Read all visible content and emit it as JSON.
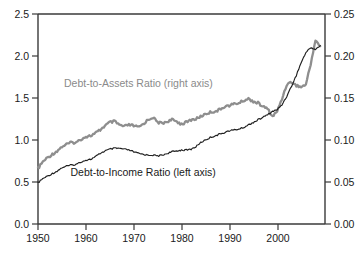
{
  "chart_data": {
    "type": "line",
    "title": "",
    "subtitle": "",
    "xlabel": "",
    "ylabel": "",
    "grid": false,
    "legend_position": "inline-annotations",
    "x": [
      1950,
      1951,
      1952,
      1953,
      1954,
      1955,
      1956,
      1957,
      1958,
      1959,
      1960,
      1961,
      1962,
      1963,
      1964,
      1965,
      1966,
      1967,
      1968,
      1969,
      1970,
      1971,
      1972,
      1973,
      1974,
      1975,
      1976,
      1977,
      1978,
      1979,
      1980,
      1981,
      1982,
      1983,
      1984,
      1985,
      1986,
      1987,
      1988,
      1989,
      1990,
      1991,
      1992,
      1993,
      1994,
      1995,
      1996,
      1997,
      1998,
      1999,
      2000,
      2001,
      2002,
      2003,
      2004,
      2005,
      2006,
      2007,
      2008,
      2009
    ],
    "xlim": [
      1950,
      2010
    ],
    "xticks": [
      1950,
      1960,
      1970,
      1980,
      1990,
      2000
    ],
    "xticklabels": [
      "1950",
      "1960",
      "1970",
      "1980",
      "1990",
      "2000"
    ],
    "axes": [
      {
        "side": "left",
        "name": "Debt-to-Income Ratio (left axis)",
        "ylim": [
          0.0,
          2.5
        ],
        "yticks": [
          0.0,
          0.5,
          1.0,
          1.5,
          2.0,
          2.5
        ],
        "yticklabels": [
          "0.0",
          "0.5",
          "1.0",
          "1.5",
          "2.0",
          "2.5"
        ]
      },
      {
        "side": "right",
        "name": "Debt-to-Assets Ratio (right axis)",
        "ylim": [
          0.0,
          0.25
        ],
        "yticks": [
          0.0,
          0.05,
          0.1,
          0.15,
          0.2,
          0.25
        ],
        "yticklabels": [
          "0.00",
          "0.05",
          "0.10",
          "0.15",
          "0.20",
          "0.25"
        ]
      }
    ],
    "series": [
      {
        "name": "Debt-to-Income Ratio (left axis)",
        "axis": "left",
        "color": "#1f1f1f",
        "linewidth": 1.15,
        "label_text": "Debt-to-Income Ratio (left axis)",
        "label_x": 1972.0,
        "label_y": 0.62,
        "values": [
          0.49,
          0.53,
          0.56,
          0.6,
          0.62,
          0.66,
          0.68,
          0.7,
          0.71,
          0.74,
          0.76,
          0.77,
          0.79,
          0.82,
          0.84,
          0.86,
          0.87,
          0.88,
          0.9,
          0.91,
          0.9,
          0.89,
          0.88,
          0.86,
          0.84,
          0.82,
          0.81,
          0.81,
          0.82,
          0.83,
          0.84,
          0.85,
          0.86,
          0.87,
          0.89,
          0.92,
          0.95,
          0.97,
          0.98,
          0.99,
          0.99,
          1.0,
          1.0,
          1.04,
          1.09,
          1.13,
          1.16,
          1.17,
          1.19,
          1.21,
          1.22,
          1.24,
          1.26,
          1.28,
          1.31,
          1.33,
          1.35,
          1.37,
          1.38,
          1.39
        ]
      },
      {
        "name": "Debt-to-Assets Ratio (right axis)",
        "axis": "right",
        "color": "#8e8e8e",
        "linewidth": 2.3,
        "label_text": "Debt-to-Assets Ratio (right axis)",
        "label_x": 1971.0,
        "label_y": 0.158,
        "values": [
          0.066,
          0.073,
          0.078,
          0.082,
          0.085,
          0.089,
          0.091,
          0.093,
          0.095,
          0.098,
          0.1,
          0.101,
          0.103,
          0.106,
          0.109,
          0.111,
          0.113,
          0.112,
          0.114,
          0.116,
          0.117,
          0.116,
          0.115,
          0.117,
          0.12,
          0.119,
          0.118,
          0.12,
          0.121,
          0.12,
          0.119,
          0.121,
          0.124,
          0.124,
          0.126,
          0.128,
          0.13,
          0.131,
          0.133,
          0.134,
          0.136,
          0.136,
          0.137,
          0.138,
          0.139,
          0.14,
          0.141,
          0.14,
          0.138,
          0.137,
          0.136,
          0.134,
          0.132,
          0.13,
          0.129,
          0.128,
          0.127,
          0.125,
          0.124,
          0.123
        ]
      }
    ],
    "series_detail_note": "Values are estimated from the plotted curves; the drawn paths carry the year-by-year detail.",
    "income_path_points": [
      [
        1950,
        0.49
      ],
      [
        1951,
        0.54
      ],
      [
        1952,
        0.57
      ],
      [
        1953,
        0.6
      ],
      [
        1954,
        0.63
      ],
      [
        1955,
        0.67
      ],
      [
        1956,
        0.69
      ],
      [
        1957,
        0.7
      ],
      [
        1958,
        0.71
      ],
      [
        1959,
        0.74
      ],
      [
        1960,
        0.76
      ],
      [
        1961,
        0.77
      ],
      [
        1962,
        0.8
      ],
      [
        1963,
        0.84
      ],
      [
        1964,
        0.87
      ],
      [
        1965,
        0.89
      ],
      [
        1966,
        0.9
      ],
      [
        1967,
        0.9
      ],
      [
        1968,
        0.89
      ],
      [
        1969,
        0.88
      ],
      [
        1970,
        0.86
      ],
      [
        1971,
        0.84
      ],
      [
        1972,
        0.83
      ],
      [
        1973,
        0.82
      ],
      [
        1974,
        0.82
      ],
      [
        1975,
        0.81
      ],
      [
        1976,
        0.82
      ],
      [
        1977,
        0.84
      ],
      [
        1978,
        0.86
      ],
      [
        1979,
        0.87
      ],
      [
        1980,
        0.88
      ],
      [
        1981,
        0.88
      ],
      [
        1982,
        0.89
      ],
      [
        1983,
        0.92
      ],
      [
        1984,
        0.97
      ],
      [
        1985,
        1.0
      ],
      [
        1986,
        1.03
      ],
      [
        1987,
        1.05
      ],
      [
        1988,
        1.07
      ],
      [
        1989,
        1.09
      ],
      [
        1990,
        1.11
      ],
      [
        1991,
        1.12
      ],
      [
        1992,
        1.13
      ],
      [
        1993,
        1.15
      ],
      [
        1994,
        1.18
      ],
      [
        1995,
        1.21
      ],
      [
        1996,
        1.24
      ],
      [
        1997,
        1.27
      ],
      [
        1998,
        1.3
      ],
      [
        1999,
        1.34
      ],
      [
        2000,
        1.36
      ],
      [
        2001,
        1.42
      ],
      [
        2002,
        1.52
      ],
      [
        2003,
        1.64
      ],
      [
        2004,
        1.77
      ],
      [
        2005,
        1.92
      ],
      [
        2006,
        2.04
      ],
      [
        2007,
        2.1
      ],
      [
        2008,
        2.08
      ],
      [
        2009,
        2.12
      ]
    ],
    "assets_path_points": [
      [
        1950,
        0.066
      ],
      [
        1951,
        0.074
      ],
      [
        1952,
        0.079
      ],
      [
        1953,
        0.083
      ],
      [
        1954,
        0.087
      ],
      [
        1955,
        0.092
      ],
      [
        1956,
        0.095
      ],
      [
        1957,
        0.097
      ],
      [
        1958,
        0.097
      ],
      [
        1959,
        0.101
      ],
      [
        1960,
        0.104
      ],
      [
        1961,
        0.105
      ],
      [
        1962,
        0.108
      ],
      [
        1963,
        0.112
      ],
      [
        1964,
        0.117
      ],
      [
        1965,
        0.121
      ],
      [
        1966,
        0.122
      ],
      [
        1967,
        0.118
      ],
      [
        1968,
        0.116
      ],
      [
        1969,
        0.118
      ],
      [
        1970,
        0.117
      ],
      [
        1971,
        0.115
      ],
      [
        1972,
        0.119
      ],
      [
        1973,
        0.124
      ],
      [
        1974,
        0.127
      ],
      [
        1975,
        0.121
      ],
      [
        1976,
        0.12
      ],
      [
        1977,
        0.122
      ],
      [
        1978,
        0.124
      ],
      [
        1979,
        0.122
      ],
      [
        1980,
        0.119
      ],
      [
        1981,
        0.121
      ],
      [
        1982,
        0.124
      ],
      [
        1983,
        0.125
      ],
      [
        1984,
        0.128
      ],
      [
        1985,
        0.131
      ],
      [
        1986,
        0.133
      ],
      [
        1987,
        0.134
      ],
      [
        1988,
        0.136
      ],
      [
        1989,
        0.14
      ],
      [
        1990,
        0.141
      ],
      [
        1991,
        0.143
      ],
      [
        1992,
        0.144
      ],
      [
        1993,
        0.147
      ],
      [
        1994,
        0.149
      ],
      [
        1995,
        0.146
      ],
      [
        1996,
        0.144
      ],
      [
        1997,
        0.14
      ],
      [
        1998,
        0.137
      ],
      [
        1999,
        0.128
      ],
      [
        2000,
        0.134
      ],
      [
        2001,
        0.149
      ],
      [
        2002,
        0.166
      ],
      [
        2003,
        0.169
      ],
      [
        2004,
        0.165
      ],
      [
        2005,
        0.163
      ],
      [
        2006,
        0.166
      ],
      [
        2007,
        0.19
      ],
      [
        2008,
        0.219
      ],
      [
        2009,
        0.211
      ]
    ],
    "annotations": [
      {
        "text": "Debt-to-Assets Ratio (right axis)",
        "color": "#8a8a8a"
      },
      {
        "text": "Debt-to-Income Ratio (left axis)",
        "color": "#1a1a1a"
      }
    ],
    "colors": {
      "income_line": "#1f1f1f",
      "assets_line": "#8e8e8e",
      "axis": "#3a3a3a",
      "background": "#ffffff"
    }
  }
}
